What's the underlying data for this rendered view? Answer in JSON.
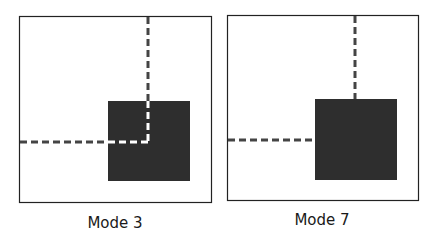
{
  "panels": [
    {
      "label": "Mode 3",
      "frame": {
        "x": 19,
        "y": 16,
        "w": 193,
        "h": 187
      },
      "square": {
        "x": 108,
        "y": 101,
        "w": 82,
        "h": 80
      },
      "vline": {
        "x": 148,
        "y1": 16,
        "y2": 142,
        "color_inside": "#ffffff"
      },
      "hline": {
        "y": 142,
        "x1": 19,
        "x2": 148,
        "color_inside": "#ffffff"
      }
    },
    {
      "label": "Mode 7",
      "frame": {
        "x": 227,
        "y": 15,
        "w": 192,
        "h": 186
      },
      "square": {
        "x": 315,
        "y": 99,
        "w": 82,
        "h": 81
      },
      "vline": {
        "x": 355,
        "y1": 15,
        "y2": 99
      },
      "hline": {
        "y": 140,
        "x1": 227,
        "x2": 315
      }
    }
  ],
  "colors": {
    "square": "#2e2e2e",
    "dash": "#444444",
    "frame": "#222222"
  }
}
